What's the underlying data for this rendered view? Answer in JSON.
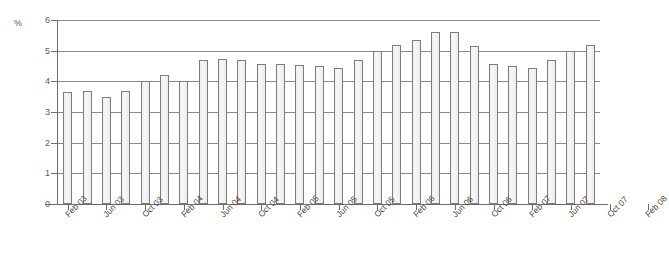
{
  "chart_data": {
    "type": "bar",
    "title": "",
    "subtitle": "",
    "xlabel": "",
    "ylabel": "%",
    "unit_label": "%",
    "ylim": [
      0,
      6
    ],
    "ytick_values": [
      0,
      1,
      2,
      3,
      4,
      5,
      6
    ],
    "ytick_labels": [
      "0",
      "1",
      "2",
      "3",
      "4",
      "5",
      "6"
    ],
    "grid": true,
    "grid_axis": "y",
    "legend": false,
    "legend_position": "none",
    "bar_count": 28,
    "categories": [
      "Feb 03",
      "Mar 03",
      "Apr 03",
      "May 03",
      "Jun 03",
      "Jul 03",
      "Aug 03",
      "Sep 03",
      "Oct 03",
      "Nov 03",
      "Dec 03",
      "Jan 04",
      "Feb 04",
      "Mar 04",
      "Apr 04",
      "May 04",
      "Jun 04",
      "Jul 04",
      "Aug 04",
      "Sep 04",
      "Oct 04",
      "Nov 04",
      "Dec 04",
      "Jan 05",
      "Feb 05",
      "Mar 05",
      "Apr 05",
      "May 05"
    ],
    "x_tick_labels": [
      "Feb 03",
      "Jun 03",
      "Oct 03",
      "Feb 04",
      "Jun 04",
      "Oct 04",
      "Feb 05",
      "Jun 05",
      "Oct 05",
      "Feb 06",
      "Jun 06",
      "Oct 06",
      "Feb 07",
      "Jun 07",
      "Oct 07",
      "Feb 08"
    ],
    "x_tick_every_n_bars": 2,
    "values": [
      3.65,
      3.68,
      3.5,
      3.7,
      4.0,
      4.22,
      4.0,
      4.7,
      4.72,
      4.7,
      4.55,
      4.55,
      4.52,
      4.5,
      4.42,
      4.7,
      5.0,
      5.18,
      5.35,
      5.62,
      5.62,
      5.15,
      4.55,
      4.5,
      4.42,
      4.7,
      5.0,
      5.18
    ],
    "series": [
      {
        "name": "Rate",
        "values": [
          3.65,
          3.68,
          3.5,
          3.7,
          4.0,
          4.22,
          4.0,
          4.7,
          4.72,
          4.7,
          4.55,
          4.55,
          4.52,
          4.5,
          4.42,
          4.7,
          5.0,
          5.18,
          5.35,
          5.62,
          5.62,
          5.15,
          4.55,
          4.5,
          4.42,
          4.7,
          5.0,
          5.18
        ]
      }
    ],
    "bar_fill_color": "#efefef",
    "bar_edge_color": "#7d7d7d",
    "grid_color": "#8a8a8a",
    "axis_color": "#6d6d6d",
    "text_color": "#4a4a4a",
    "background_color": "#ffffff",
    "min_value": 3.5,
    "max_value": 5.62,
    "first_value": 3.65,
    "last_value": 5.15
  }
}
